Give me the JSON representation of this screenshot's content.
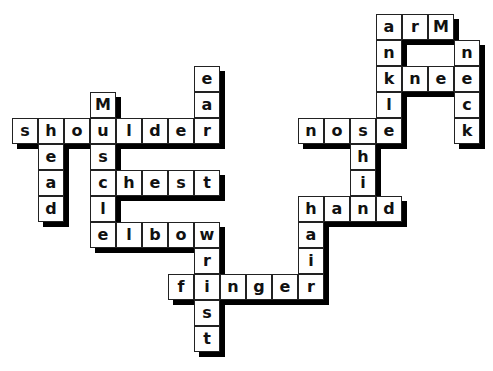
{
  "puzzle": {
    "type": "crossword-body-parts",
    "cell_size": 26,
    "origin": {
      "x": 12,
      "y": 14
    },
    "shadow_offset": 5,
    "colors": {
      "cell_bg": "#ffffff",
      "border": "#222222",
      "shadow": "#000000",
      "text": "#111111"
    },
    "words": [
      {
        "word": "arm",
        "dir": "across",
        "row": 0,
        "col": 14,
        "display": [
          "a",
          "r",
          "M"
        ]
      },
      {
        "word": "ankle",
        "dir": "down",
        "row": 0,
        "col": 14
      },
      {
        "word": "knee",
        "dir": "across",
        "row": 2,
        "col": 14
      },
      {
        "word": "neck",
        "dir": "down",
        "row": 1,
        "col": 17
      },
      {
        "word": "nose",
        "dir": "across",
        "row": 4,
        "col": 11
      },
      {
        "word": "shin",
        "dir": "down",
        "row": 4,
        "col": 13
      },
      {
        "word": "hand",
        "dir": "across",
        "row": 7,
        "col": 11
      },
      {
        "word": "hair",
        "dir": "down",
        "row": 7,
        "col": 11
      },
      {
        "word": "finger",
        "dir": "across",
        "row": 10,
        "col": 6
      },
      {
        "word": "wrist",
        "dir": "down",
        "row": 8,
        "col": 7
      },
      {
        "word": "elbow",
        "dir": "across",
        "row": 8,
        "col": 3
      },
      {
        "word": "muscle",
        "dir": "down",
        "row": 3,
        "col": 3,
        "display": [
          "M",
          "u",
          "s",
          "c",
          "l",
          "e"
        ]
      },
      {
        "word": "chest",
        "dir": "across",
        "row": 6,
        "col": 3
      },
      {
        "word": "shoulder",
        "dir": "across",
        "row": 4,
        "col": 0
      },
      {
        "word": "ear",
        "dir": "down",
        "row": 2,
        "col": 7
      },
      {
        "word": "head",
        "dir": "down",
        "row": 4,
        "col": 1
      }
    ]
  }
}
